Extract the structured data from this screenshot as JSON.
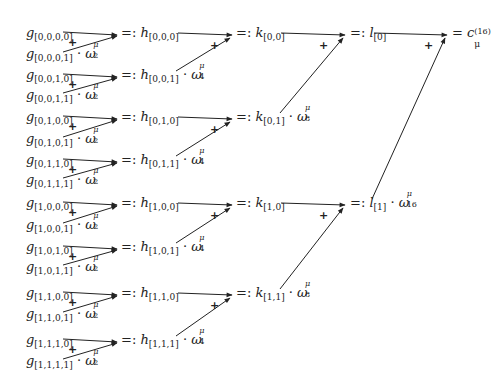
{
  "diagram": {
    "type": "butterfly-recursion",
    "stage_g": [
      {
        "name": "g",
        "index": "[0,0,0,0]",
        "twiddle": null
      },
      {
        "name": "g",
        "index": "[0,0,0,1]",
        "twiddle": "2"
      },
      {
        "name": "g",
        "index": "[0,0,1,0]",
        "twiddle": null
      },
      {
        "name": "g",
        "index": "[0,0,1,1]",
        "twiddle": "2"
      },
      {
        "name": "g",
        "index": "[0,1,0,0]",
        "twiddle": null
      },
      {
        "name": "g",
        "index": "[0,1,0,1]",
        "twiddle": "2"
      },
      {
        "name": "g",
        "index": "[0,1,1,0]",
        "twiddle": null
      },
      {
        "name": "g",
        "index": "[0,1,1,1]",
        "twiddle": "2"
      },
      {
        "name": "g",
        "index": "[1,0,0,0]",
        "twiddle": null
      },
      {
        "name": "g",
        "index": "[1,0,0,1]",
        "twiddle": "2"
      },
      {
        "name": "g",
        "index": "[1,0,1,0]",
        "twiddle": null
      },
      {
        "name": "g",
        "index": "[1,0,1,1]",
        "twiddle": "2"
      },
      {
        "name": "g",
        "index": "[1,1,0,0]",
        "twiddle": null
      },
      {
        "name": "g",
        "index": "[1,1,0,1]",
        "twiddle": "2"
      },
      {
        "name": "g",
        "index": "[1,1,1,0]",
        "twiddle": null
      },
      {
        "name": "g",
        "index": "[1,1,1,1]",
        "twiddle": "2"
      }
    ],
    "stage_h": [
      {
        "name": "h",
        "index": "[0,0,0]",
        "twiddle": null
      },
      {
        "name": "h",
        "index": "[0,0,1]",
        "twiddle": "4"
      },
      {
        "name": "h",
        "index": "[0,1,0]",
        "twiddle": null
      },
      {
        "name": "h",
        "index": "[0,1,1]",
        "twiddle": "4"
      },
      {
        "name": "h",
        "index": "[1,0,0]",
        "twiddle": null
      },
      {
        "name": "h",
        "index": "[1,0,1]",
        "twiddle": "4"
      },
      {
        "name": "h",
        "index": "[1,1,0]",
        "twiddle": null
      },
      {
        "name": "h",
        "index": "[1,1,1]",
        "twiddle": "4"
      }
    ],
    "stage_k": [
      {
        "name": "k",
        "index": "[0,0]",
        "twiddle": null
      },
      {
        "name": "k",
        "index": "[0,1]",
        "twiddle": "8"
      },
      {
        "name": "k",
        "index": "[1,0]",
        "twiddle": null
      },
      {
        "name": "k",
        "index": "[1,1]",
        "twiddle": "8"
      }
    ],
    "stage_l": [
      {
        "name": "l",
        "index": "[0]",
        "twiddle": null
      },
      {
        "name": "l",
        "index": "[1]",
        "twiddle": "16"
      }
    ],
    "result": {
      "name": "c",
      "sub": "μ",
      "sup": "(16)"
    },
    "define_symbol": "=:",
    "equals_symbol": "=",
    "plus_symbol": "+",
    "dot_symbol": "·",
    "omega_symbol": "ω",
    "mu_symbol": "μ"
  }
}
